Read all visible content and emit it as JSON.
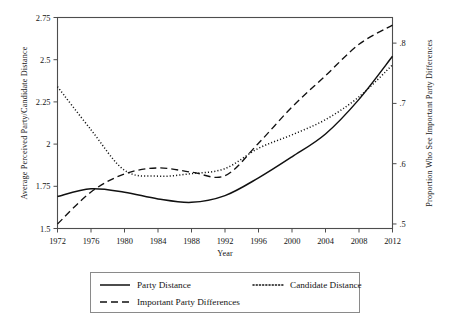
{
  "chart_data": {
    "type": "line",
    "title": "",
    "xlabel": "Year",
    "ylabel": "Average Perceived Party/Candidate Distance",
    "y2label": "Proportion Who See Important Party Differences",
    "x": [
      1972,
      1976,
      1980,
      1984,
      1988,
      1992,
      1996,
      2000,
      2004,
      2008,
      2012
    ],
    "xlim": [
      1972,
      2012
    ],
    "ylim": [
      1.5,
      2.75
    ],
    "y2lim": [
      0.4925,
      0.8425
    ],
    "xticks": [
      1972,
      1976,
      1980,
      1984,
      1988,
      1992,
      1996,
      2000,
      2004,
      2008,
      2012
    ],
    "xticklabels": [
      "1972",
      "1976",
      "1980",
      "1984",
      "1988",
      "1992",
      "1996",
      "2000",
      "2004",
      "2008",
      "2012"
    ],
    "yticks": [
      1.5,
      1.75,
      2,
      2.25,
      2.5,
      2.75
    ],
    "yticklabels": [
      "1.5",
      "1.75",
      "2",
      "2.25",
      "2.5",
      "2.75"
    ],
    "y2ticks": [
      0.5,
      0.6,
      0.7,
      0.8
    ],
    "y2ticklabels": [
      ".5",
      ".6",
      ".7",
      ".8"
    ],
    "grid": false,
    "legend_position": "below-center",
    "series": [
      {
        "name": "Party Distance",
        "style": "solid",
        "axis": "left",
        "values": [
          1.69,
          1.735,
          1.715,
          1.675,
          1.655,
          1.695,
          1.8,
          1.925,
          2.06,
          2.265,
          2.52
        ]
      },
      {
        "name": "Candidate Distance",
        "style": "dotted",
        "axis": "left",
        "values": [
          2.34,
          2.085,
          1.845,
          1.81,
          1.825,
          1.855,
          1.975,
          2.055,
          2.145,
          2.28,
          2.47
        ]
      },
      {
        "name": "Important Party Differences",
        "style": "dashed",
        "axis": "right",
        "values": [
          0.5,
          0.553,
          0.583,
          0.593,
          0.586,
          0.58,
          0.634,
          0.694,
          0.746,
          0.798,
          0.83
        ]
      }
    ]
  },
  "legend": {
    "entries": [
      {
        "label": "Party Distance",
        "style": "solid"
      },
      {
        "label": "Candidate Distance",
        "style": "dotted"
      },
      {
        "label": "Important Party Differences",
        "style": "dashed"
      }
    ]
  }
}
